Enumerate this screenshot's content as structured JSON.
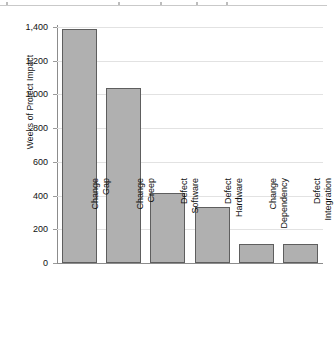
{
  "chart_data": {
    "type": "bar",
    "title": "",
    "xlabel": "",
    "ylabel": "Weeks of Project Impact",
    "ylim": [
      0,
      1400
    ],
    "ytick_step": 200,
    "grid": true,
    "legend": "none",
    "bar_color": "#b0b0b0",
    "bar_edge_color": "#5e5e5e",
    "gridline_color": "#e2e2e2",
    "axis_color": "#8c8c8c",
    "categories": [
      "Change Gap",
      "Change Creep",
      "Defect Software",
      "Defect Hardware",
      "Change Dependency",
      "Defect Integration"
    ],
    "category_lines": [
      [
        "Change",
        "Gap"
      ],
      [
        "Change",
        "Creep"
      ],
      [
        "Defect",
        "Software"
      ],
      [
        "Defect",
        "Hardware"
      ],
      [
        "Change",
        "Dependency"
      ],
      [
        "Defect",
        "Integration"
      ]
    ],
    "values": [
      1390,
      1040,
      415,
      335,
      115,
      110
    ],
    "ytick_labels": [
      "0",
      "200",
      "400",
      "600",
      "800",
      "1,000",
      "1,200",
      "1,400"
    ],
    "ytick_values": [
      0,
      200,
      400,
      600,
      800,
      1000,
      1200,
      1400
    ]
  }
}
